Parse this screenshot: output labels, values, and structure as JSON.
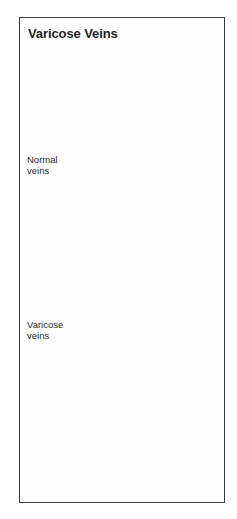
{
  "figure": {
    "title": "Varicose Veins",
    "labels": {
      "normal": {
        "line1": "Normal",
        "line2": "veins"
      },
      "varicose": {
        "line1": "Varicose",
        "line2": "veins"
      }
    },
    "illustration": "leg-with-veins",
    "colors": {
      "stroke": "#1e1e1e",
      "border": "#3a3a3a",
      "background": "#ffffff"
    }
  }
}
